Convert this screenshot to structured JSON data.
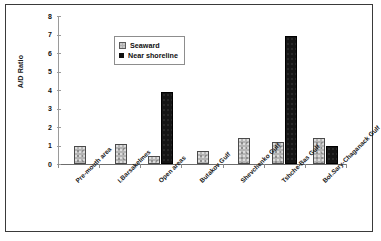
{
  "chart_data": {
    "type": "bar",
    "title": "",
    "xlabel": "",
    "ylabel": "A/D Ratio",
    "ylim": [
      0,
      8
    ],
    "ytick_labels": [
      "0",
      "1",
      "2",
      "3",
      "4",
      "5",
      "6",
      "7",
      "8"
    ],
    "ytick_values": [
      0,
      1,
      2,
      3,
      4,
      5,
      6,
      7,
      8
    ],
    "grid": false,
    "legend_position": "upper-left-inside",
    "categories": [
      "Pre-mouth area",
      "I.Barsakelmes",
      "Open areas",
      "Butakov Gulf",
      "Shevchenko Gulf",
      "Tshche-Bas Gulf",
      "Bol.Sary-Chaganack Gulf"
    ],
    "series": [
      {
        "name": "Seaward",
        "color": "#b4b4b4",
        "values": [
          1.0,
          1.1,
          0.45,
          0.7,
          1.4,
          1.2,
          1.4
        ]
      },
      {
        "name": "Near shoreline",
        "color": "#151515",
        "values": [
          null,
          null,
          3.9,
          null,
          null,
          6.9,
          1.0
        ]
      }
    ]
  },
  "legend": {
    "items": [
      {
        "label": "Seaward",
        "swatch": "seaward-swatch-icon"
      },
      {
        "label": "Near shoreline",
        "swatch": "near-shoreline-swatch-icon"
      }
    ]
  },
  "axes": {
    "y_title": "A/D Ratio"
  }
}
